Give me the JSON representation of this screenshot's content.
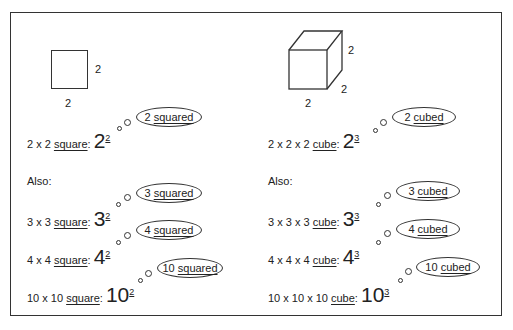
{
  "left": {
    "shape_labels": {
      "side": "2",
      "bottom": "2"
    },
    "rows": [
      {
        "text": "2 x 2 ",
        "word": "square",
        "suffix": ":",
        "base": "2",
        "exp": "2",
        "bubble_num": "2",
        "bubble_word": "squared"
      },
      {
        "text": "3 x 3 ",
        "word": "square",
        "suffix": ":",
        "base": "3",
        "exp": "2",
        "bubble_num": "3",
        "bubble_word": "squared"
      },
      {
        "text": "4 x 4 ",
        "word": "square",
        "suffix": ":",
        "base": "4",
        "exp": "2",
        "bubble_num": "4",
        "bubble_word": "squared"
      },
      {
        "text": "10 x 10 ",
        "word": "square",
        "suffix": ":",
        "base": "10",
        "exp": "2",
        "bubble_num": "10",
        "bubble_word": "squared"
      }
    ],
    "also": "Also:"
  },
  "right": {
    "shape_labels": {
      "height": "2",
      "depth": "2",
      "bottom": "2"
    },
    "rows": [
      {
        "text": "2 x 2 x 2 ",
        "word": "cube",
        "suffix": ":",
        "base": "2",
        "exp": "3",
        "bubble_num": "2",
        "bubble_word": "cubed"
      },
      {
        "text": "3 x 3 x 3 ",
        "word": "cube",
        "suffix": ":",
        "base": "3",
        "exp": "3",
        "bubble_num": "3",
        "bubble_word": "cubed"
      },
      {
        "text": "4 x 4 x 4 ",
        "word": "cube",
        "suffix": ":",
        "base": "4",
        "exp": "3",
        "bubble_num": "4",
        "bubble_word": "cubed"
      },
      {
        "text": "10 x 10 x 10 ",
        "word": "cube",
        "suffix": ":",
        "base": "10",
        "exp": "3",
        "bubble_num": "10",
        "bubble_word": "cubed"
      }
    ],
    "also": "Also:"
  }
}
